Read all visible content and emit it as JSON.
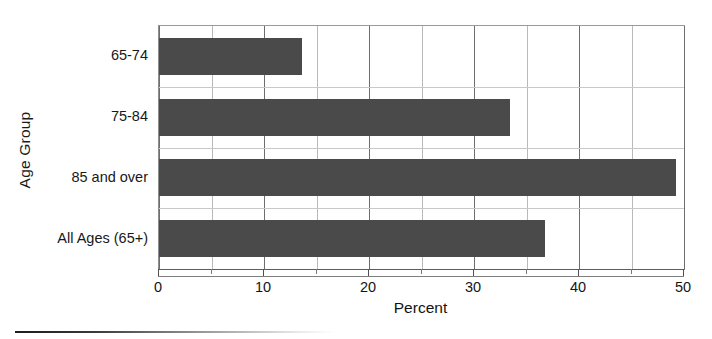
{
  "chart_data": {
    "type": "bar",
    "orientation": "horizontal",
    "title": "",
    "xlabel": "Percent",
    "ylabel": "Age Group",
    "categories": [
      "65-74",
      "75-84",
      "85 and over",
      "All Ages (65+)"
    ],
    "values": [
      13.6,
      33.4,
      49.2,
      36.8
    ],
    "series": [
      {
        "name": "Percent",
        "values": [
          13.6,
          33.4,
          49.2,
          36.8
        ]
      }
    ],
    "xlim": [
      0,
      50
    ],
    "xticks": [
      0,
      10,
      20,
      30,
      40,
      50
    ],
    "xtick_labels": [
      "0",
      "10",
      "20",
      "30",
      "40",
      "50"
    ],
    "minor_xticks": [
      5,
      15,
      25,
      35,
      45
    ],
    "grid": "vertical-major-and-minor",
    "legend": "none",
    "bar_color": "#4a4a4a",
    "gridline_color": "#6e6e6e",
    "minor_gridline_color": "#b9b9b9",
    "plot_border_color": "#8d8d8d",
    "background_color": "#ffffff"
  }
}
